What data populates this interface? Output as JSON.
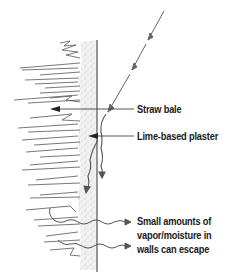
{
  "diagram": {
    "type": "cross-section illustration",
    "labels": {
      "straw_bale": "Straw bale",
      "lime_plaster": "Lime-based plaster",
      "moisture_line1": "Small amounts of",
      "moisture_line2": "vapor/moisture in",
      "moisture_line3": "walls can escape"
    },
    "icons": {
      "rain_arrow": "diagonal-dashed-arrow-icon",
      "runoff_arrow": "downward-squiggle-arrow-icon",
      "vapor_arrow": "wavy-right-arrow-icon",
      "leader_arrow": "left-pointing-leader-arrow-icon"
    },
    "colors": {
      "ink": "#4a4a4a",
      "plaster_stipple": "#c8c8c8",
      "text": "#1a1a1a",
      "background": "#ffffff"
    }
  }
}
